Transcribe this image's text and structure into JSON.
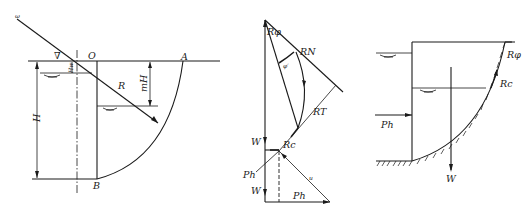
{
  "figures": {
    "left": {
      "description": "Circular slip surface cross-section with water levels",
      "labels": {
        "omega": "ω",
        "origin": "O",
        "point_a": "A",
        "point_b": "B",
        "radius": "R",
        "height": "H",
        "height_m": "mH",
        "height_w": "Hw",
        "water_symbol": "∇"
      }
    },
    "middle": {
      "description": "Force polygon",
      "labels": {
        "r_phi": "Rφ",
        "r_n": "RN",
        "phi_prime": "φ′",
        "r_t": "RT",
        "r_c": "Rc",
        "w_top": "W",
        "w_bottom": "W",
        "p_h_left": "Ph",
        "p_h_bottom": "Ph",
        "u": "u"
      }
    },
    "right": {
      "description": "Sliding block with forces",
      "labels": {
        "r_phi": "Rφ",
        "r_c": "Rc",
        "p_h": "Ph",
        "w": "W"
      }
    }
  }
}
